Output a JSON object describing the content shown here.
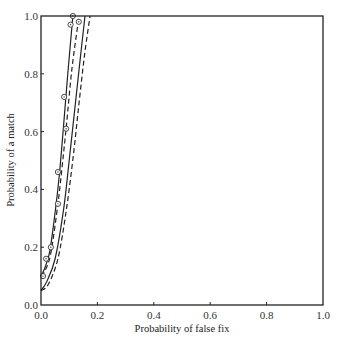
{
  "chart_data": {
    "type": "line",
    "title": "",
    "xlabel": "Probability of false fix",
    "ylabel": "Probability of a match",
    "xlim": [
      0.0,
      1.0
    ],
    "ylim": [
      0.0,
      1.0
    ],
    "x_ticks": [
      "0.0",
      "0.2",
      "0.4",
      "0.6",
      "0.8",
      "1.0"
    ],
    "y_ticks": [
      "0.0",
      "0.2",
      "0.4",
      "0.6",
      "0.8",
      "1.0"
    ],
    "grid": false,
    "legend": null,
    "series": [
      {
        "name": "solid-1",
        "style": "solid",
        "markers": true,
        "points": [
          [
            0.0,
            0.1
          ],
          [
            0.01,
            0.12
          ],
          [
            0.03,
            0.18
          ],
          [
            0.05,
            0.32
          ],
          [
            0.065,
            0.45
          ],
          [
            0.08,
            0.62
          ],
          [
            0.095,
            0.8
          ],
          [
            0.113,
            1.0
          ]
        ]
      },
      {
        "name": "dashed-1",
        "style": "dashed",
        "markers": true,
        "points": [
          [
            0.0,
            0.1
          ],
          [
            0.015,
            0.12
          ],
          [
            0.035,
            0.18
          ],
          [
            0.06,
            0.35
          ],
          [
            0.075,
            0.48
          ],
          [
            0.09,
            0.62
          ],
          [
            0.11,
            0.82
          ],
          [
            0.135,
            1.0
          ]
        ]
      },
      {
        "name": "solid-2",
        "style": "solid",
        "markers": false,
        "points": [
          [
            0.0,
            0.05
          ],
          [
            0.02,
            0.08
          ],
          [
            0.05,
            0.16
          ],
          [
            0.08,
            0.33
          ],
          [
            0.1,
            0.5
          ],
          [
            0.12,
            0.68
          ],
          [
            0.14,
            0.86
          ],
          [
            0.156,
            1.0
          ]
        ]
      },
      {
        "name": "dashed-2",
        "style": "dashed",
        "markers": false,
        "points": [
          [
            0.0,
            0.05
          ],
          [
            0.025,
            0.07
          ],
          [
            0.06,
            0.16
          ],
          [
            0.09,
            0.33
          ],
          [
            0.115,
            0.52
          ],
          [
            0.135,
            0.7
          ],
          [
            0.155,
            0.87
          ],
          [
            0.174,
            1.0
          ]
        ]
      }
    ],
    "marker_points": [
      [
        0.007,
        0.1
      ],
      [
        0.018,
        0.16
      ],
      [
        0.035,
        0.2
      ],
      [
        0.06,
        0.35
      ],
      [
        0.06,
        0.46
      ],
      [
        0.089,
        0.61
      ],
      [
        0.082,
        0.72
      ],
      [
        0.105,
        0.97
      ],
      [
        0.113,
        1.0
      ],
      [
        0.134,
        0.98
      ]
    ]
  }
}
